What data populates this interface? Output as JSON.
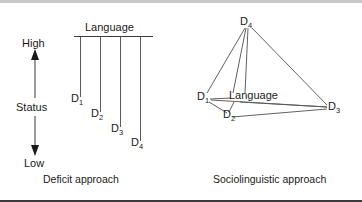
{
  "figure": {
    "title": "",
    "panels": [
      {
        "id": "deficit",
        "caption": "Deficit approach",
        "language_label": "Language",
        "axis": {
          "top_label": "High",
          "middle_label": "Status",
          "bottom_label": "Low"
        },
        "nodes": [
          {
            "base": "D",
            "sub": "1"
          },
          {
            "base": "D",
            "sub": "2"
          },
          {
            "base": "D",
            "sub": "3"
          },
          {
            "base": "D",
            "sub": "4"
          }
        ]
      },
      {
        "id": "sociolinguistic",
        "caption": "Sociolinguistic approach",
        "language_label": "Language",
        "nodes": [
          {
            "base": "D",
            "sub": "1"
          },
          {
            "base": "D",
            "sub": "2"
          },
          {
            "base": "D",
            "sub": "3"
          },
          {
            "base": "D",
            "sub": "4"
          }
        ]
      }
    ]
  },
  "colors": {
    "ink": "#1a1a1a",
    "line": "#5a5a5a",
    "rule": "#4a4a4a",
    "border_top": "#c9c9c9",
    "border_bottom": "#3a3a3a",
    "background": "#ffffff"
  }
}
